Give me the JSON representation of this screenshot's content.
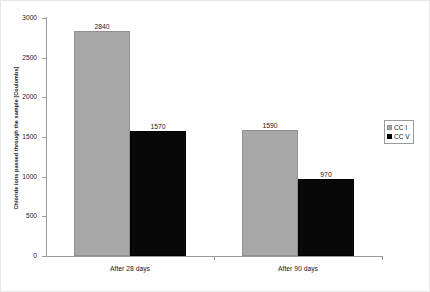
{
  "chart_data": {
    "type": "bar",
    "title": "",
    "subtitle": "",
    "xlabel": "",
    "ylabel": "Chloride ions passed through the sample [Coulombs]",
    "categories": [
      "After 28 days",
      "After 90 days"
    ],
    "series": [
      {
        "name": "CC I",
        "values": [
          2840,
          1590
        ],
        "color": "#a8a8a8"
      },
      {
        "name": "CC V",
        "values": [
          1570,
          970
        ],
        "color": "#080808"
      }
    ],
    "data_labels": [
      "2840",
      "1570",
      "1590",
      "970"
    ],
    "ylim": [
      0,
      3000
    ],
    "ytick_values": [
      0,
      500,
      1000,
      1500,
      2000,
      2500,
      3000
    ],
    "ytick_labels": [
      "0",
      "500",
      "1000",
      "1500",
      "2000",
      "2500",
      "3000"
    ],
    "grid": false,
    "legend_position": "right",
    "legend_entries": [
      "CC I",
      "CC V"
    ],
    "axis_color": "#9a9a9a",
    "text_color": "#1a1a1a"
  }
}
